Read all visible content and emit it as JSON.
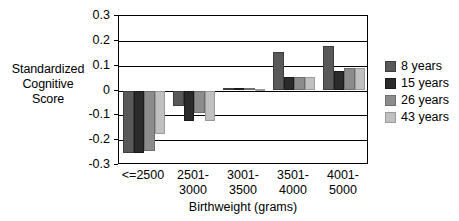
{
  "chart_data": {
    "type": "bar",
    "title": "",
    "subtitle": "",
    "xlabel": "Birthweight (grams)",
    "ylabel": "Standardized Cognitive Score",
    "ylabel_lines": [
      "Standardized",
      "Cognitive",
      "Score"
    ],
    "categories": [
      "<=2500",
      "2501-3000",
      "3001-3500",
      "3501-4000",
      "4001-5000"
    ],
    "category_lines": [
      [
        "<=2500",
        ""
      ],
      [
        "2501-",
        "3000"
      ],
      [
        "3001-",
        "3500"
      ],
      [
        "3501-",
        "4000"
      ],
      [
        "4001-",
        "5000"
      ]
    ],
    "series": [
      {
        "name": "8 years",
        "color": "#595959",
        "values": [
          -0.252,
          -0.063,
          0.01,
          0.155,
          0.18
        ]
      },
      {
        "name": "15 years",
        "color": "#2b2b2b",
        "values": [
          -0.252,
          -0.123,
          0.01,
          0.055,
          0.08
        ]
      },
      {
        "name": "26 years",
        "color": "#8c8c8c",
        "values": [
          -0.245,
          -0.09,
          0.01,
          0.055,
          0.09
        ]
      },
      {
        "name": "43 years",
        "color": "#c0c0c0",
        "values": [
          -0.175,
          -0.123,
          0.008,
          0.055,
          0.09
        ]
      }
    ],
    "ylim": [
      -0.3,
      0.3
    ],
    "yticks": [
      0.3,
      0.2,
      0.1,
      0,
      -0.1,
      -0.2,
      -0.3
    ],
    "ytick_labels": [
      "0.3",
      "0.2",
      "0.1",
      "0",
      "-0.1",
      "-0.2",
      "-0.3"
    ],
    "grid": true,
    "grid_axis": "y",
    "legend_position": "right",
    "legend_entries": [
      "8 years",
      "15 years",
      "26 years",
      "43 years"
    ]
  }
}
